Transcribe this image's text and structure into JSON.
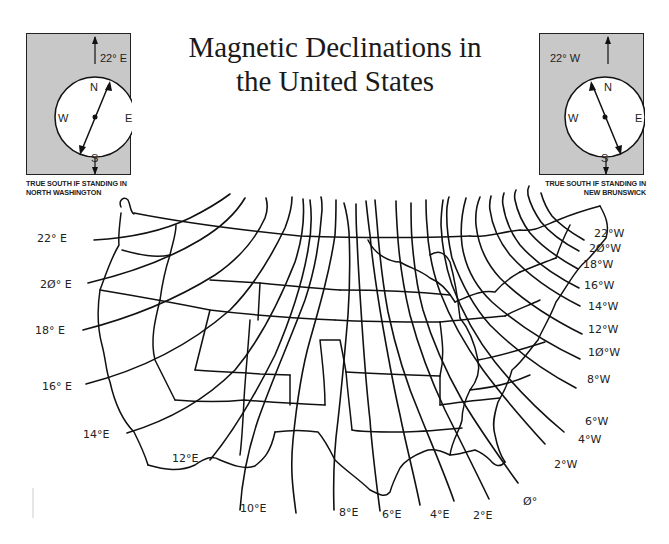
{
  "title": {
    "line1": "Magnetic Declinations in",
    "line2": "the United States"
  },
  "compass_left": {
    "declination_label": "22° E",
    "cardinal": {
      "n": "N",
      "s": "S",
      "e": "E",
      "w": "W"
    },
    "caption_line1": "TRUE SOUTH IF STANDING IN",
    "caption_line2": "NORTH WASHINGTON",
    "box_color": "#c8c8c8"
  },
  "compass_right": {
    "declination_label": "22° W",
    "cardinal": {
      "n": "N",
      "s": "S",
      "e": "E",
      "w": "W"
    },
    "caption_line1": "TRUE SOUTH IF STANDING IN",
    "caption_line2": "NEW BRUNSWICK",
    "box_color": "#c8c8c8"
  },
  "isogonic_labels": {
    "east": [
      "22° E",
      "2Ø° E",
      "18° E",
      "16° E",
      "14°E",
      "12°E",
      "10°E",
      "8°E",
      "6°E",
      "4°E",
      "2°E"
    ],
    "zero": "Ø°",
    "west": [
      "22°W",
      "2Ø°W",
      "18°W",
      "16°W",
      "14°W",
      "12°W",
      "1Ø°W",
      "8°W",
      "6°W",
      "4°W",
      "2°W"
    ]
  }
}
